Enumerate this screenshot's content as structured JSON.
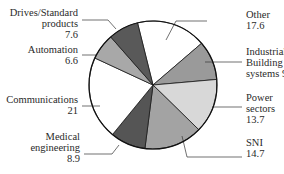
{
  "chart_data": {
    "type": "pie",
    "title": "",
    "unit": "percent",
    "order": "clockwise from top",
    "slices": [
      {
        "label": "Other",
        "label_lines": [
          "Other",
          "17.6"
        ],
        "value": 17.6,
        "color": "#ffffff"
      },
      {
        "label": "Industrial/Building systems",
        "label_lines": [
          "Industrial/",
          "Building",
          "systems 9.9"
        ],
        "value": 9.9,
        "color": "#9a9a9a"
      },
      {
        "label": "Power sectors",
        "label_lines": [
          "Power",
          "sectors",
          "13.7"
        ],
        "value": 13.7,
        "color": "#d8d8d8"
      },
      {
        "label": "SNI",
        "label_lines": [
          "SNI",
          "14.7"
        ],
        "value": 14.7,
        "color": "#a3a3a3"
      },
      {
        "label": "Medical engineering",
        "label_lines": [
          "Medical",
          "engineering",
          "8.9"
        ],
        "value": 8.9,
        "color": "#555555"
      },
      {
        "label": "Communications",
        "label_lines": [
          "Communications",
          "21"
        ],
        "value": 21,
        "color": "#ffffff"
      },
      {
        "label": "Automation",
        "label_lines": [
          "Automation",
          "6.6"
        ],
        "value": 6.6,
        "color": "#a8a8a8"
      },
      {
        "label": "Drives/Standard products",
        "label_lines": [
          "Drives/Standard",
          "products",
          "7.6"
        ],
        "value": 7.6,
        "color": "#595959"
      }
    ],
    "legend": "none (direct labels with leader lines)"
  }
}
